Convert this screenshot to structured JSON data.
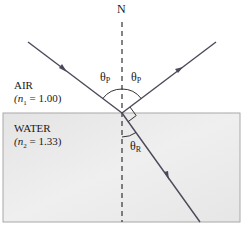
{
  "diagram": {
    "normal_label": "N",
    "media": {
      "upper": {
        "name": "AIR",
        "index_label": "(n",
        "index_sub": "1",
        "index_value": " = 1.00)"
      },
      "lower": {
        "name": "WATER",
        "index_label": "(n",
        "index_sub": "2",
        "index_value": " = 1.33)"
      }
    },
    "angles": {
      "incident": {
        "symbol": "θ",
        "sub": "P"
      },
      "reflected": {
        "symbol": "θ",
        "sub": "P"
      },
      "refracted": {
        "symbol": "θ",
        "sub": "R"
      }
    },
    "rays": [
      "incident",
      "reflected",
      "refracted"
    ],
    "annotations": [
      "right-angle between reflected and refracted rays"
    ],
    "colors": {
      "ray": "#4a4a5a",
      "water": "#e6e6e6",
      "water_border": "#9a9a9a",
      "text": "#1a1a1a"
    }
  }
}
